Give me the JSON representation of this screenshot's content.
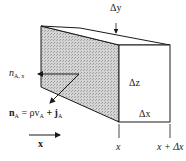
{
  "figure": {
    "colors": {
      "line": "#1a1a1a",
      "shaded_face": "#c8c8c8",
      "background": "#ffffff"
    }
  },
  "labels": {
    "delta_y": "Δy",
    "delta_z": "Δz",
    "delta_x": "Δx",
    "x_left": "x",
    "x_right": "x + Δx",
    "flux_component": {
      "main": "n",
      "sub": "A, x"
    },
    "flux_vector": {
      "lhs": "n",
      "lhs_sub": "A",
      "eq": " = ρv",
      "v_sub": "A",
      "plus": " + j",
      "j_sub": "A"
    },
    "axis": "x"
  }
}
